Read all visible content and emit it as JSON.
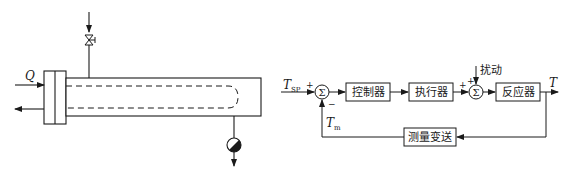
{
  "left_diagram": {
    "flow_label": "Q"
  },
  "right_diagram": {
    "setpoint_label": "T",
    "setpoint_sub": "SP",
    "measured_label": "T",
    "measured_sub": "m",
    "output_label": "T",
    "disturbance_label": "扰动",
    "sum_symbol": "Σ",
    "plus": "+",
    "minus": "−",
    "blocks": {
      "controller": "控制器",
      "actuator": "执行器",
      "reactor": "反应器",
      "measurement": "测量变送"
    }
  }
}
